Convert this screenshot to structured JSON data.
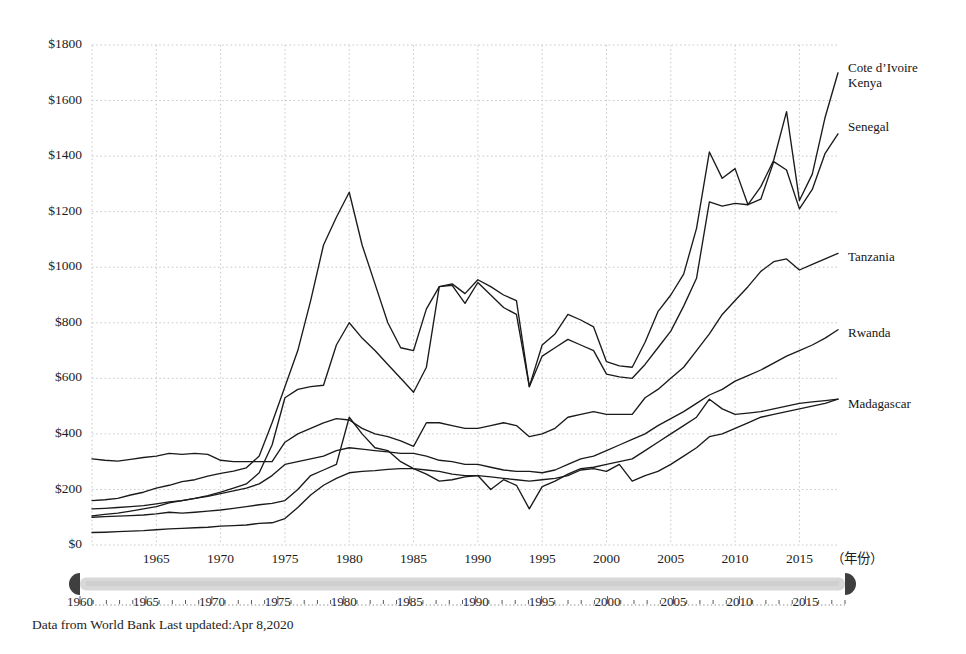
{
  "footer": {
    "note": "Data from World Bank Last updated:Apr 8,2020"
  },
  "axes": {
    "x_unit_label": "（年份）",
    "y_tick_labels": [
      "$0",
      "$200",
      "$400",
      "$600",
      "$800",
      "$1000",
      "$1200",
      "$1400",
      "$1600",
      "$1800"
    ],
    "x_tick_labels": [
      "1965",
      "1970",
      "1975",
      "1980",
      "1985",
      "1990",
      "1995",
      "2000",
      "2005",
      "2010",
      "2015"
    ]
  },
  "range_slider": {
    "start_label": "1960",
    "end_label": "2018",
    "tick_labels": [
      "1960",
      "1965",
      "1970",
      "1975",
      "1980",
      "1985",
      "1990",
      "1995",
      "2000",
      "2005",
      "2010",
      "2015"
    ],
    "handle_left_name": "range-start-handle",
    "handle_right_name": "range-end-handle"
  },
  "colors": {
    "line": "#1a1a1a",
    "grid": "#c9c9c9",
    "slider_track": "#d8d8d8",
    "slider_handle": "#3f3f3f",
    "background": "#ffffff"
  },
  "chart_data": {
    "type": "line",
    "title": "",
    "subtitle": "",
    "xlabel": "（年份）",
    "ylabel": "",
    "xlim": [
      1960,
      2018
    ],
    "ylim": [
      0,
      1800
    ],
    "ytick_step": 200,
    "xtick_step": 5,
    "grid": true,
    "legend_position": "right-inline-labels",
    "x": [
      1960,
      1961,
      1962,
      1963,
      1964,
      1965,
      1966,
      1967,
      1968,
      1969,
      1970,
      1971,
      1972,
      1973,
      1974,
      1975,
      1976,
      1977,
      1978,
      1979,
      1980,
      1981,
      1982,
      1983,
      1984,
      1985,
      1986,
      1987,
      1988,
      1989,
      1990,
      1991,
      1992,
      1993,
      1994,
      1995,
      1996,
      1997,
      1998,
      1999,
      2000,
      2001,
      2002,
      2003,
      2004,
      2005,
      2006,
      2007,
      2008,
      2009,
      2010,
      2011,
      2012,
      2013,
      2014,
      2015,
      2016,
      2017,
      2018
    ],
    "series": [
      {
        "name": "Cote d'Ivoire",
        "label": "Cote d’Ivoire",
        "values": [
          160,
          163,
          168,
          180,
          190,
          205,
          215,
          228,
          235,
          248,
          258,
          266,
          278,
          320,
          440,
          570,
          700,
          880,
          1080,
          1180,
          1270,
          1080,
          940,
          800,
          710,
          700,
          850,
          930,
          940,
          905,
          955,
          930,
          900,
          880,
          570,
          720,
          760,
          830,
          810,
          785,
          660,
          645,
          640,
          730,
          840,
          900,
          975,
          1140,
          1415,
          1320,
          1355,
          1225,
          1290,
          1385,
          1560,
          1240,
          1335,
          1540,
          1700
        ]
      },
      {
        "name": "Kenya",
        "values": [
          105,
          110,
          115,
          122,
          130,
          138,
          152,
          160,
          168,
          178,
          190,
          205,
          220,
          260,
          360,
          530,
          560,
          570,
          575,
          720,
          800,
          745,
          700,
          650,
          600,
          550,
          640,
          930,
          935,
          870,
          945,
          900,
          855,
          830,
          570,
          680,
          710,
          740,
          720,
          700,
          615,
          605,
          600,
          650,
          710,
          770,
          860,
          960,
          1235,
          1220,
          1230,
          1225,
          1245,
          1380,
          1350,
          1210,
          1280,
          1410,
          1480
        ]
      },
      {
        "name": "Senegal",
        "values": [
          310,
          305,
          302,
          308,
          315,
          320,
          330,
          326,
          330,
          326,
          305,
          300,
          300,
          300,
          300,
          370,
          400,
          420,
          440,
          455,
          450,
          420,
          400,
          390,
          375,
          355,
          440,
          440,
          430,
          420,
          420,
          430,
          440,
          430,
          390,
          400,
          420,
          460,
          470,
          480,
          470,
          470,
          470,
          530,
          560,
          600,
          640,
          700,
          760,
          830,
          880,
          930,
          985,
          1020,
          1030,
          990,
          1010,
          1030,
          1050
        ]
      },
      {
        "name": "Tanzania",
        "values": [
          130,
          132,
          135,
          138,
          142,
          148,
          155,
          160,
          168,
          175,
          185,
          195,
          205,
          220,
          250,
          290,
          300,
          310,
          320,
          340,
          350,
          345,
          340,
          335,
          330,
          330,
          320,
          305,
          300,
          290,
          290,
          280,
          270,
          265,
          265,
          260,
          270,
          290,
          310,
          320,
          340,
          360,
          380,
          400,
          430,
          455,
          480,
          510,
          540,
          560,
          590,
          610,
          630,
          655,
          680,
          700,
          720,
          745,
          775
        ]
      },
      {
        "name": "Rwanda",
        "values": [
          45,
          46,
          48,
          50,
          52,
          55,
          58,
          60,
          62,
          64,
          68,
          70,
          72,
          78,
          80,
          95,
          135,
          180,
          215,
          240,
          260,
          265,
          268,
          272,
          275,
          275,
          270,
          265,
          255,
          250,
          250,
          200,
          235,
          215,
          130,
          210,
          230,
          255,
          275,
          280,
          290,
          300,
          310,
          340,
          370,
          400,
          430,
          460,
          525,
          490,
          470,
          475,
          480,
          490,
          500,
          510,
          515,
          520,
          525
        ]
      },
      {
        "name": "Madagascar",
        "values": [
          100,
          102,
          104,
          106,
          108,
          112,
          118,
          115,
          118,
          122,
          126,
          132,
          138,
          145,
          150,
          160,
          200,
          250,
          270,
          290,
          460,
          400,
          350,
          340,
          300,
          275,
          255,
          230,
          235,
          245,
          250,
          245,
          240,
          235,
          230,
          235,
          240,
          250,
          270,
          275,
          265,
          290,
          230,
          250,
          265,
          290,
          320,
          350,
          390,
          400,
          420,
          440,
          460,
          470,
          480,
          490,
          500,
          510,
          525
        ]
      }
    ],
    "series_label_positions": [
      {
        "name": "Cote d'Ivoire",
        "label": "Cote d’Ivoire",
        "value_2018": 1700
      },
      {
        "name": "Kenya",
        "label": "Kenya",
        "value_2018": 1480
      },
      {
        "name": "Senegal",
        "label": "Senegal",
        "value_2018": 1050
      },
      {
        "name": "Tanzania",
        "label": "Tanzania",
        "value_2018": 775
      },
      {
        "name": "Rwanda",
        "label": "Rwanda",
        "value_2018": 525
      },
      {
        "name": "Madagascar",
        "label": "Madagascar",
        "value_2018": 525
      }
    ]
  }
}
